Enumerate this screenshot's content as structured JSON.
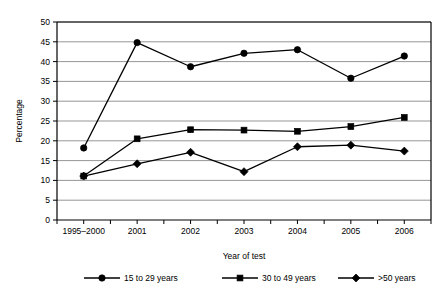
{
  "chart_data": {
    "type": "line",
    "title": "",
    "xlabel": "Year of test",
    "ylabel": "Percentage",
    "categories": [
      "1995–2000",
      "2001",
      "2002",
      "2003",
      "2004",
      "2005",
      "2006"
    ],
    "ylim": [
      0,
      50
    ],
    "ytick_step": 5,
    "yticks": [
      "0",
      "5",
      "10",
      "15",
      "20",
      "25",
      "30",
      "35",
      "40",
      "45",
      "50"
    ],
    "grid": "horizontal",
    "legend_position": "bottom",
    "series": [
      {
        "name": "15 to 29 years",
        "marker": "circle",
        "values": [
          18.2,
          44.8,
          38.7,
          42.1,
          43.0,
          35.8,
          41.4
        ]
      },
      {
        "name": "30 to 49 years",
        "marker": "square",
        "values": [
          11.1,
          20.5,
          22.8,
          22.7,
          22.4,
          23.6,
          25.9
        ]
      },
      {
        "name": ">50 years",
        "marker": "diamond",
        "values": [
          11.1,
          14.2,
          17.1,
          12.2,
          18.5,
          18.9,
          17.4
        ]
      }
    ],
    "colors": {
      "series": "#000000",
      "grid": "#8a8a8a",
      "axis": "#000000",
      "background": "#ffffff"
    }
  }
}
